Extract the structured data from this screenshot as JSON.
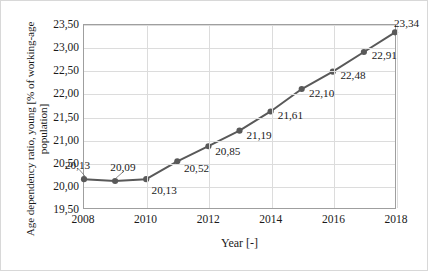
{
  "chart_data": {
    "type": "line",
    "title": "",
    "xlabel": "Year [-]",
    "ylabel": "Age dependency ratio, young [% of working-age population]",
    "categories": [
      2008,
      2009,
      2010,
      2011,
      2012,
      2013,
      2014,
      2015,
      2016,
      2017,
      2018
    ],
    "values": [
      20.13,
      20.09,
      20.13,
      20.52,
      20.85,
      21.19,
      21.61,
      22.1,
      22.48,
      22.91,
      23.34
    ],
    "point_labels": [
      "20,13",
      "20,09",
      "20,13",
      "20,52",
      "20,85",
      "21,19",
      "21,61",
      "22,10",
      "22,48",
      "22,91",
      "23,34"
    ],
    "xlim": [
      2008,
      2018
    ],
    "ylim": [
      19.5,
      23.5
    ],
    "xticks": [
      2008,
      2010,
      2012,
      2014,
      2016,
      2018
    ],
    "xtick_labels": [
      "2008",
      "2010",
      "2012",
      "2014",
      "2016",
      "2018"
    ],
    "yticks": [
      19.5,
      20.0,
      20.5,
      21.0,
      21.5,
      22.0,
      22.5,
      23.0,
      23.5
    ],
    "ytick_labels": [
      "19,50",
      "20,00",
      "20,50",
      "21,00",
      "21,50",
      "22,00",
      "22,50",
      "23,00",
      "23,50"
    ],
    "grid": true,
    "legend": false,
    "series_color": "#595959",
    "marker": "circle",
    "marker_size": 5,
    "line_width": 2
  }
}
